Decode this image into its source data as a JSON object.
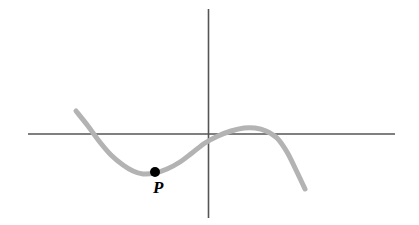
{
  "figure": {
    "background_color": "#ffffff",
    "width": 419,
    "height": 225,
    "axis_color": "#555555",
    "curve_color": "#b3b3b3",
    "point_color": "#000000",
    "label_color": "#000000"
  },
  "labels": {
    "point_p": "P"
  },
  "chart_data": {
    "type": "line",
    "title": "",
    "subtitle": "",
    "xlabel": "",
    "ylabel": "",
    "grid": false,
    "legend": false,
    "legend_position": "none",
    "axes": {
      "x_axis": {
        "pixel_y": 134,
        "pixel_x_start": 28,
        "pixel_x_end": 395,
        "color": "#555555",
        "arrowheads": false,
        "ticks": [],
        "tick_labels": []
      },
      "y_axis": {
        "pixel_x": 208,
        "pixel_y_start": 9,
        "pixel_y_end": 218,
        "color": "#555555",
        "arrowheads": false,
        "ticks": [],
        "tick_labels": []
      },
      "origin": {
        "pixel_x": 208,
        "pixel_y": 134
      },
      "xlim_pixels": [
        28,
        395
      ],
      "ylim_pixels": [
        9,
        218
      ]
    },
    "series": [
      {
        "name": "cubic-curve",
        "color": "#b3b3b3",
        "stroke_width": 5,
        "description": "cubic-like curve decreasing to a local minimum, rising through near the origin to a local maximum just above the x-axis, then decreasing",
        "points_pixel": [
          [
            76,
            111
          ],
          [
            88,
            126
          ],
          [
            99,
            141
          ],
          [
            111,
            155
          ],
          [
            123,
            165
          ],
          [
            133,
            171
          ],
          [
            143,
            174
          ],
          [
            155,
            173
          ],
          [
            167,
            169
          ],
          [
            180,
            162
          ],
          [
            192,
            153
          ],
          [
            205,
            143
          ],
          [
            218,
            136
          ],
          [
            231,
            131
          ],
          [
            244,
            128
          ],
          [
            255,
            128
          ],
          [
            266,
            131
          ],
          [
            277,
            138
          ],
          [
            287,
            152
          ],
          [
            296,
            170
          ],
          [
            305,
            189
          ]
        ],
        "features": {
          "left_endpoint_pixel": [
            76,
            111
          ],
          "right_endpoint_pixel": [
            305,
            189
          ],
          "local_minimum_pixel": [
            143,
            174
          ],
          "local_maximum_pixel": [
            255,
            128
          ],
          "x_axis_crossings_pixel": [
            95,
            277
          ]
        }
      }
    ],
    "annotations": [
      {
        "name": "point-p",
        "label": "P",
        "marker": "filled-circle",
        "marker_radius_px": 5,
        "pixel_x": 155,
        "pixel_y": 172,
        "label_pixel_x": 153,
        "label_pixel_y": 176,
        "color": "#000000"
      }
    ]
  }
}
